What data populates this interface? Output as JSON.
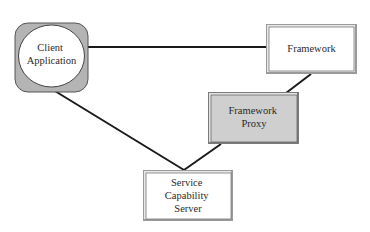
{
  "diagram": {
    "nodes": {
      "client": {
        "lines": [
          "Client",
          "Application"
        ],
        "fill": "#b4b4b4",
        "inner_fill": "#ffffff"
      },
      "framework": {
        "lines": [
          "Framework"
        ],
        "fill": "#ffffff"
      },
      "proxy": {
        "lines": [
          "Framework",
          "Proxy"
        ],
        "fill": "#cfcfcf"
      },
      "scs": {
        "lines": [
          "Service",
          "Capability",
          "Server"
        ],
        "fill": "#ffffff"
      }
    },
    "edges": [
      {
        "from": "Client Application",
        "to": "Framework"
      },
      {
        "from": "Client Application",
        "to": "Service Capability Server"
      },
      {
        "from": "Framework",
        "to": "Framework Proxy"
      },
      {
        "from": "Framework Proxy",
        "to": "Service Capability Server"
      }
    ],
    "colors": {
      "line": "#1a1a1a",
      "border": "#555555",
      "bevel_light": "#e8e8e8",
      "bevel_dark": "#7a7a7a"
    }
  }
}
